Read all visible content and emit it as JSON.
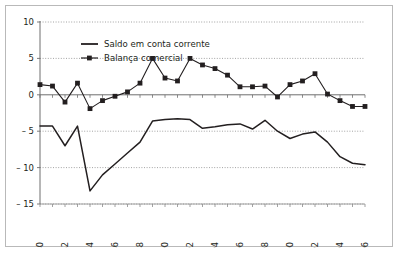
{
  "chart_data": {
    "type": "line",
    "title": "",
    "xlabel": "",
    "ylabel": "",
    "ylim": [
      -15,
      10
    ],
    "xlim": [
      1980,
      2006
    ],
    "grid": true,
    "grid_axis": "y",
    "legend_position": "top-center",
    "yticks": [
      "10",
      "5",
      "0",
      "-5",
      "-10",
      "-15"
    ],
    "ytick_values": [
      10,
      5,
      0,
      -5,
      -10,
      -15
    ],
    "xticks": [
      "1980",
      "1982",
      "1984",
      "1986",
      "1988",
      "1990",
      "1992",
      "1994",
      "1996",
      "1998",
      "2000",
      "2002",
      "2004",
      "2006"
    ],
    "xtick_values": [
      1980,
      1982,
      1984,
      1986,
      1988,
      1990,
      1992,
      1994,
      1996,
      1998,
      2000,
      2002,
      2004,
      2006
    ],
    "x": [
      1980,
      1981,
      1982,
      1983,
      1984,
      1985,
      1986,
      1987,
      1988,
      1989,
      1990,
      1991,
      1992,
      1993,
      1994,
      1995,
      1996,
      1997,
      1998,
      1999,
      2000,
      2001,
      2002,
      2003,
      2004,
      2005,
      2006
    ],
    "series": [
      {
        "name": "Saldo em conta corrente",
        "marker": "none",
        "color": "#231f20",
        "values": [
          -4.3,
          -4.3,
          -7.0,
          -4.3,
          -13.2,
          -11.0,
          -9.5,
          -8.0,
          -6.5,
          -3.6,
          -3.4,
          -3.3,
          -3.4,
          -4.6,
          -4.4,
          -4.1,
          -4.0,
          -4.7,
          -3.5,
          -5.0,
          -6.0,
          -5.4,
          -5.1,
          -6.5,
          -8.5,
          -9.4,
          -9.6
        ]
      },
      {
        "name": "Balança comercial",
        "marker": "square",
        "color": "#231f20",
        "values": [
          1.4,
          1.2,
          -1.0,
          1.6,
          -1.9,
          -0.8,
          -0.2,
          0.4,
          1.6,
          5.0,
          2.3,
          1.9,
          5.0,
          4.1,
          3.6,
          2.7,
          1.1,
          1.1,
          1.2,
          -0.3,
          1.4,
          1.9,
          2.9,
          0.1,
          -0.8,
          -1.6,
          -1.6
        ]
      }
    ]
  },
  "legend": {
    "items": [
      {
        "label": "Saldo em conta corrente",
        "style": "line"
      },
      {
        "label": "Balança comercial",
        "style": "line-marker"
      }
    ]
  }
}
